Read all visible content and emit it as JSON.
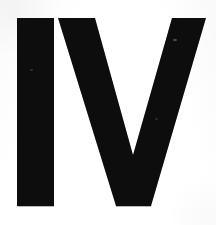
{
  "image": {
    "kind": "scanned-glyph",
    "width": 216,
    "height": 225,
    "caption": "IV",
    "text_content": "IV",
    "background_color": "#ffffff",
    "ink_color": "#000000",
    "edge_shadow_color": "#4a4a4a"
  },
  "glyphs": [
    {
      "name": "letter-I",
      "character": "I",
      "role": "roman-numeral-one",
      "ink_color": "#080808",
      "bounds": {
        "x": 17,
        "y": 18,
        "width": 37,
        "height": 188
      },
      "shape": "rectangle"
    },
    {
      "name": "letter-V",
      "character": "V",
      "role": "roman-numeral-five",
      "ink_color": "#080808",
      "bounds": {
        "x": 58,
        "y": 18,
        "width": 148,
        "height": 188
      },
      "shape": "vee",
      "left_arm_top": {
        "x1": 58,
        "x2": 95
      },
      "right_arm_top": {
        "x1": 172,
        "x2": 206
      },
      "bottom_flat": {
        "x1": 116,
        "x2": 151,
        "y": 206
      },
      "inner_apex": {
        "x": 133,
        "y": 155
      }
    }
  ],
  "artifacts": [
    {
      "name": "scan-speck-right-arm",
      "x": 173,
      "y": 39
    },
    {
      "name": "scan-speck-left-stem",
      "x": 30,
      "y": 69
    },
    {
      "name": "scan-speck-right-lower",
      "x": 155,
      "y": 118
    }
  ]
}
